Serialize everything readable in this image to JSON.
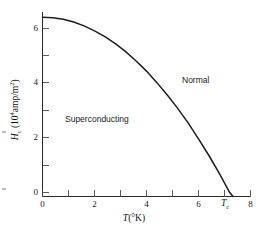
{
  "figure": {
    "background_color": "#ffffff",
    "line_color": "#1d1d1d"
  },
  "axes": {
    "x": {
      "title_html": "T (°K)",
      "title_var": "T",
      "title_unit": "(°K)",
      "tick_labels": [
        "0",
        "2",
        "4",
        "6",
        "8"
      ],
      "tick_values": [
        0,
        2,
        4,
        6,
        8
      ],
      "minor_tick_values": [
        1,
        3,
        5,
        7
      ],
      "range": [
        0,
        8
      ]
    },
    "y": {
      "title_var": "H",
      "title_sub": "c",
      "title_unit_prefix": " (10",
      "title_unit_exp": "4",
      "title_unit_suffix": "amp/m",
      "title_unit_exp2": "2",
      "title_unit_close": ")",
      "tick_labels": [
        "0",
        "2",
        "4",
        "6"
      ],
      "tick_values": [
        0,
        2,
        4,
        6
      ],
      "minor_tick_values": [
        1,
        3,
        5,
        7
      ],
      "range": [
        0,
        7
      ]
    }
  },
  "annotations": {
    "superconducting_label": "Superconducting",
    "normal_label": "Normal",
    "critical_temp_symbol": "T",
    "critical_temp_subscript": "c"
  },
  "chart_data": {
    "type": "line",
    "title": "",
    "xlabel": "T (°K)",
    "ylabel": "Hc (10^4 amp/m^2)",
    "xlim": [
      0,
      8
    ],
    "ylim": [
      0,
      7
    ],
    "grid": false,
    "legend": "none",
    "series": [
      {
        "name": "Critical field Hc(T)",
        "x": [
          0.0,
          0.4,
          0.8,
          1.2,
          1.6,
          2.0,
          2.4,
          2.8,
          3.2,
          3.6,
          4.0,
          4.4,
          4.8,
          5.2,
          5.6,
          6.0,
          6.4,
          6.8,
          7.2
        ],
        "y": [
          6.4,
          6.38,
          6.32,
          6.22,
          6.08,
          5.9,
          5.69,
          5.43,
          5.14,
          4.8,
          4.43,
          4.01,
          3.56,
          3.07,
          2.54,
          1.96,
          1.35,
          0.7,
          0.0
        ]
      }
    ],
    "annotations": [
      {
        "text": "Superconducting",
        "x": 2.0,
        "y": 3.0
      },
      {
        "text": "Normal",
        "x": 5.6,
        "y": 5.1
      },
      {
        "text": "Tc",
        "x": 7.2,
        "y": 0.0
      }
    ]
  }
}
